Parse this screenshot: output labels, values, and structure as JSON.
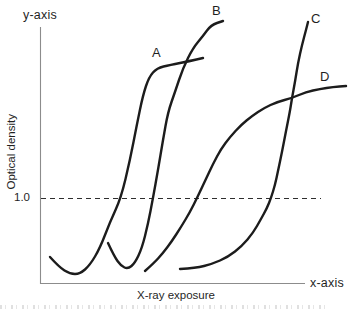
{
  "figure": {
    "y_axis_end_label": "y-axis",
    "x_axis_end_label": "x-axis",
    "y_axis_title": "Optical density",
    "x_axis_title": "X-ray exposure",
    "reference_value_label": "1.0"
  },
  "colors": {
    "curve": "#1c1c1c",
    "axis_line": "#8c8c8c",
    "dashed_line": "#2e2e2e",
    "text": "#1f1f1f",
    "background": "#ffffff"
  },
  "chart_data": {
    "type": "line",
    "title": "",
    "xlabel": "X-ray exposure",
    "ylabel": "Optical density",
    "x_axis_end_label": "x-axis",
    "y_axis_end_label": "y-axis",
    "axes_unlabeled": true,
    "grid": false,
    "legend_position": "labels-at-curve-ends",
    "reference_line": {
      "value": 1.0,
      "axis": "y",
      "style": "dashed",
      "label": "1.0"
    },
    "ylim": [
      0,
      3.5
    ],
    "xlim": [
      0,
      10
    ],
    "series": [
      {
        "name": "A",
        "description": "steep high-contrast curve, leftmost (fastest film)",
        "points": [
          [
            0.38,
            0.31
          ],
          [
            0.72,
            0.19
          ],
          [
            1.13,
            0.11
          ],
          [
            1.51,
            0.11
          ],
          [
            1.89,
            0.21
          ],
          [
            2.26,
            0.41
          ],
          [
            2.64,
            0.72
          ],
          [
            3.06,
            1.0
          ],
          [
            3.4,
            1.45
          ],
          [
            3.66,
            1.87
          ],
          [
            3.89,
            2.21
          ],
          [
            4.11,
            2.42
          ],
          [
            4.42,
            2.53
          ],
          [
            4.91,
            2.56
          ],
          [
            5.66,
            2.62
          ],
          [
            6.15,
            2.65
          ]
        ],
        "points_px": [
          [
            50,
            257
          ],
          [
            59,
            267
          ],
          [
            70,
            274
          ],
          [
            80,
            274
          ],
          [
            90,
            265
          ],
          [
            100,
            248
          ],
          [
            110,
            222
          ],
          [
            121,
            198
          ],
          [
            130,
            160
          ],
          [
            137,
            124
          ],
          [
            143,
            95
          ],
          [
            149,
            77
          ],
          [
            157,
            68
          ],
          [
            170,
            65
          ],
          [
            190,
            61
          ],
          [
            203,
            58
          ]
        ],
        "label_pos_px": [
          152,
          46
        ]
      },
      {
        "name": "B",
        "description": "steep curve reaching highest density",
        "points": [
          [
            2.57,
            0.47
          ],
          [
            2.79,
            0.32
          ],
          [
            3.06,
            0.2
          ],
          [
            3.32,
            0.16
          ],
          [
            3.58,
            0.24
          ],
          [
            3.85,
            0.41
          ],
          [
            4.08,
            0.69
          ],
          [
            4.26,
            1.0
          ],
          [
            4.45,
            1.33
          ],
          [
            4.64,
            1.68
          ],
          [
            4.83,
            2.01
          ],
          [
            5.09,
            2.25
          ],
          [
            5.4,
            2.53
          ],
          [
            5.77,
            2.76
          ],
          [
            6.15,
            2.91
          ],
          [
            6.45,
            3.04
          ],
          [
            6.91,
            3.08
          ]
        ],
        "points_px": [
          [
            108,
            243
          ],
          [
            114,
            256
          ],
          [
            121,
            266
          ],
          [
            128,
            269
          ],
          [
            135,
            263
          ],
          [
            142,
            248
          ],
          [
            148,
            224
          ],
          [
            153,
            198
          ],
          [
            158,
            170
          ],
          [
            163,
            140
          ],
          [
            168,
            112
          ],
          [
            175,
            92
          ],
          [
            183,
            68
          ],
          [
            193,
            48
          ],
          [
            203,
            36
          ],
          [
            211,
            25
          ],
          [
            223,
            21
          ]
        ],
        "label_pos_px": [
          212,
          4
        ]
      },
      {
        "name": "C",
        "description": "steep curve shifted right (slowest high-contrast film)",
        "points": [
          [
            5.28,
            0.16
          ],
          [
            5.89,
            0.18
          ],
          [
            6.49,
            0.22
          ],
          [
            7.09,
            0.31
          ],
          [
            7.62,
            0.44
          ],
          [
            8.04,
            0.59
          ],
          [
            8.34,
            0.75
          ],
          [
            8.57,
            0.88
          ],
          [
            8.72,
            1.0
          ],
          [
            8.87,
            1.15
          ],
          [
            8.98,
            1.31
          ],
          [
            9.13,
            1.54
          ],
          [
            9.28,
            1.78
          ],
          [
            9.43,
            2.01
          ],
          [
            9.51,
            2.18
          ],
          [
            9.62,
            2.36
          ],
          [
            9.74,
            2.59
          ],
          [
            9.89,
            2.8
          ],
          [
            10.04,
            2.98
          ],
          [
            10.11,
            3.07
          ]
        ],
        "points_px": [
          [
            180,
            269
          ],
          [
            196,
            268
          ],
          [
            212,
            264
          ],
          [
            228,
            257
          ],
          [
            242,
            246
          ],
          [
            253,
            233
          ],
          [
            261,
            219
          ],
          [
            267,
            208
          ],
          [
            271,
            198
          ],
          [
            275,
            185
          ],
          [
            278,
            171
          ],
          [
            282,
            152
          ],
          [
            286,
            131
          ],
          [
            290,
            111
          ],
          [
            292,
            98
          ],
          [
            295,
            82
          ],
          [
            298,
            63
          ],
          [
            302,
            45
          ],
          [
            306,
            30
          ],
          [
            308,
            22
          ]
        ],
        "label_pos_px": [
          311,
          12
        ]
      },
      {
        "name": "D",
        "description": "shallow low-contrast curve crossing curve C",
        "points": [
          [
            3.96,
            0.14
          ],
          [
            4.3,
            0.24
          ],
          [
            4.64,
            0.35
          ],
          [
            4.98,
            0.49
          ],
          [
            5.32,
            0.66
          ],
          [
            5.66,
            0.84
          ],
          [
            5.92,
            1.0
          ],
          [
            6.23,
            1.2
          ],
          [
            6.53,
            1.4
          ],
          [
            6.83,
            1.58
          ],
          [
            7.17,
            1.72
          ],
          [
            7.58,
            1.86
          ],
          [
            8.0,
            1.96
          ],
          [
            8.45,
            2.06
          ],
          [
            8.94,
            2.13
          ],
          [
            9.51,
            2.18
          ],
          [
            10.04,
            2.25
          ],
          [
            10.57,
            2.28
          ],
          [
            11.06,
            2.31
          ],
          [
            11.55,
            2.32
          ]
        ],
        "points_px": [
          [
            145,
            271
          ],
          [
            154,
            263
          ],
          [
            163,
            253
          ],
          [
            172,
            241
          ],
          [
            181,
            227
          ],
          [
            190,
            212
          ],
          [
            197,
            198
          ],
          [
            205,
            181
          ],
          [
            213,
            164
          ],
          [
            221,
            149
          ],
          [
            230,
            137
          ],
          [
            241,
            125
          ],
          [
            252,
            116
          ],
          [
            264,
            108
          ],
          [
            277,
            102
          ],
          [
            292,
            98
          ],
          [
            306,
            92
          ],
          [
            320,
            89
          ],
          [
            333,
            87
          ],
          [
            346,
            86
          ]
        ],
        "label_pos_px": [
          320,
          70
        ]
      }
    ],
    "geometry_px": {
      "y_axis": {
        "x": 40,
        "y1": 27,
        "y2": 284
      },
      "x_axis": {
        "y": 283,
        "x1": 40,
        "x2": 305
      },
      "reference_line": {
        "y": 198,
        "x1": 41,
        "x2": 321,
        "dash": "5 4"
      }
    }
  }
}
